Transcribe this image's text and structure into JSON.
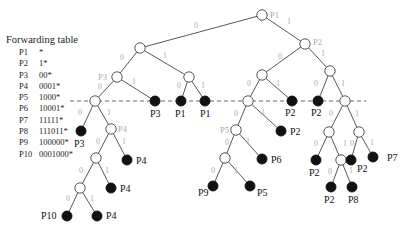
{
  "forwarding_table": {
    "title": "Forwarding table",
    "entries": [
      {
        "prefix_name": "P1",
        "prefix": "*"
      },
      {
        "prefix_name": "P2",
        "prefix": "1*"
      },
      {
        "prefix_name": "P3",
        "prefix": "00*"
      },
      {
        "prefix_name": "P4",
        "prefix": "0001*"
      },
      {
        "prefix_name": "P5",
        "prefix": "1000*"
      },
      {
        "prefix_name": "P6",
        "prefix": "10001*"
      },
      {
        "prefix_name": "P7",
        "prefix": "11111*"
      },
      {
        "prefix_name": "P8",
        "prefix": "111011*"
      },
      {
        "prefix_name": "P9",
        "prefix": "100000*"
      },
      {
        "prefix_name": "P10",
        "prefix": "0001000*"
      }
    ]
  },
  "colors": {
    "edge": "#444444",
    "edge_label": "#aaaaaa",
    "gray_prefix_label": "#aaaaaa",
    "leaf_fill": "#111111",
    "node_fill": "#ffffff",
    "dashed_line": "#555555"
  },
  "tree": {
    "dashed_line": {
      "x1": 70,
      "x2": 366,
      "y": 101
    },
    "nodes": [
      {
        "id": "root",
        "x": 262,
        "y": 15,
        "leaf": false,
        "label": "P1",
        "label_style": "gray",
        "lx": 270,
        "ly": 18
      },
      {
        "id": "0",
        "x": 140,
        "y": 48,
        "leaf": false
      },
      {
        "id": "1",
        "x": 305,
        "y": 44,
        "leaf": false,
        "label": "P2",
        "label_style": "gray",
        "lx": 313,
        "ly": 45
      },
      {
        "id": "00",
        "x": 117,
        "y": 77,
        "leaf": false,
        "label": "P3",
        "label_style": "gray",
        "lx": 98,
        "ly": 80
      },
      {
        "id": "01",
        "x": 189,
        "y": 77,
        "leaf": false
      },
      {
        "id": "000",
        "x": 95,
        "y": 101,
        "leaf": false
      },
      {
        "id": "001",
        "x": 155,
        "y": 101,
        "leaf": true,
        "label": "P3",
        "label_style": "black",
        "lx": 150,
        "ly": 117
      },
      {
        "id": "010",
        "x": 181,
        "y": 101,
        "leaf": true,
        "label": "P1",
        "label_style": "black",
        "lx": 175,
        "ly": 117
      },
      {
        "id": "011",
        "x": 205,
        "y": 101,
        "leaf": true,
        "label": "P1",
        "label_style": "black",
        "lx": 200,
        "ly": 117
      },
      {
        "id": "0000",
        "x": 81,
        "y": 131,
        "leaf": true,
        "label": "P3",
        "label_style": "black",
        "lx": 74,
        "ly": 147
      },
      {
        "id": "0001",
        "x": 111,
        "y": 129,
        "leaf": false,
        "label": "P4",
        "label_style": "gray",
        "lx": 118,
        "ly": 132
      },
      {
        "id": "00010",
        "x": 96,
        "y": 158,
        "leaf": false
      },
      {
        "id": "00011",
        "x": 127,
        "y": 160,
        "leaf": true,
        "label": "P4",
        "label_style": "black",
        "lx": 136,
        "ly": 164
      },
      {
        "id": "000100",
        "x": 80,
        "y": 188,
        "leaf": false
      },
      {
        "id": "000101",
        "x": 111,
        "y": 188,
        "leaf": true,
        "label": "P4",
        "label_style": "black",
        "lx": 120,
        "ly": 192
      },
      {
        "id": "0001000",
        "x": 67,
        "y": 216,
        "leaf": true,
        "label": "P10",
        "label_style": "black",
        "lx": 41,
        "ly": 219
      },
      {
        "id": "0001001",
        "x": 97,
        "y": 216,
        "leaf": true,
        "label": "P4",
        "label_style": "black",
        "lx": 106,
        "ly": 219
      },
      {
        "id": "10",
        "x": 262,
        "y": 75,
        "leaf": false
      },
      {
        "id": "11",
        "x": 330,
        "y": 71,
        "leaf": false
      },
      {
        "id": "100",
        "x": 248,
        "y": 101,
        "leaf": false
      },
      {
        "id": "101",
        "x": 292,
        "y": 101,
        "leaf": true,
        "label": "P2",
        "label_style": "black",
        "lx": 285,
        "ly": 116
      },
      {
        "id": "110",
        "x": 318,
        "y": 101,
        "leaf": true,
        "label": "P2",
        "label_style": "black",
        "lx": 311,
        "ly": 116
      },
      {
        "id": "111",
        "x": 345,
        "y": 101,
        "leaf": false
      },
      {
        "id": "1000",
        "x": 236,
        "y": 130,
        "leaf": false,
        "label": "P5",
        "label_style": "gray",
        "lx": 220,
        "ly": 133
      },
      {
        "id": "1001",
        "x": 281,
        "y": 131,
        "leaf": true,
        "label": "P2",
        "label_style": "black",
        "lx": 290,
        "ly": 135
      },
      {
        "id": "10000",
        "x": 225,
        "y": 158,
        "leaf": false
      },
      {
        "id": "10001",
        "x": 262,
        "y": 159,
        "leaf": true,
        "label": "P6",
        "label_style": "black",
        "lx": 271,
        "ly": 163
      },
      {
        "id": "100000",
        "x": 213,
        "y": 186,
        "leaf": true,
        "label": "P9",
        "label_style": "black",
        "lx": 198,
        "ly": 196
      },
      {
        "id": "100001",
        "x": 250,
        "y": 186,
        "leaf": true,
        "label": "P5",
        "label_style": "black",
        "lx": 257,
        "ly": 196
      },
      {
        "id": "1110",
        "x": 329,
        "y": 132,
        "leaf": false
      },
      {
        "id": "1111",
        "x": 359,
        "y": 132,
        "leaf": false
      },
      {
        "id": "11100",
        "x": 316,
        "y": 160,
        "leaf": true,
        "label": "P2",
        "label_style": "black",
        "lx": 309,
        "ly": 176
      },
      {
        "id": "11101",
        "x": 341,
        "y": 160,
        "leaf": false
      },
      {
        "id": "11110",
        "x": 351,
        "y": 160,
        "leaf": true,
        "label": "P2",
        "label_style": "black",
        "lx": 357,
        "ly": 172
      },
      {
        "id": "11111",
        "x": 373,
        "y": 157,
        "leaf": true,
        "label": "P7",
        "label_style": "black",
        "lx": 387,
        "ly": 161
      },
      {
        "id": "111010",
        "x": 331,
        "y": 187,
        "leaf": true,
        "label": "P2",
        "label_style": "black",
        "lx": 324,
        "ly": 203
      },
      {
        "id": "111011",
        "x": 352,
        "y": 187,
        "leaf": true,
        "label": "P8",
        "label_style": "black",
        "lx": 348,
        "ly": 203
      }
    ],
    "edges": [
      {
        "from": "root",
        "to": "0",
        "bit": "0",
        "lx": 196,
        "ly": 28
      },
      {
        "from": "root",
        "to": "1",
        "bit": "1",
        "lx": 289,
        "ly": 24
      },
      {
        "from": "0",
        "to": "00",
        "bit": "0",
        "lx": 122,
        "ly": 60
      },
      {
        "from": "0",
        "to": "01",
        "bit": "1",
        "lx": 165,
        "ly": 58
      },
      {
        "from": "1",
        "to": "10",
        "bit": "0",
        "lx": 280,
        "ly": 59
      },
      {
        "from": "1",
        "to": "11",
        "bit": "1",
        "lx": 323,
        "ly": 56
      },
      {
        "from": "00",
        "to": "000",
        "bit": "0",
        "lx": 100,
        "ly": 89
      },
      {
        "from": "00",
        "to": "001",
        "bit": "1",
        "lx": 134,
        "ly": 84
      },
      {
        "from": "01",
        "to": "010",
        "bit": "0",
        "lx": 179,
        "ly": 88
      },
      {
        "from": "01",
        "to": "011",
        "bit": "1",
        "lx": 203,
        "ly": 88
      },
      {
        "from": "10",
        "to": "100",
        "bit": "0",
        "lx": 249,
        "ly": 86
      },
      {
        "from": "10",
        "to": "101",
        "bit": "1",
        "lx": 278,
        "ly": 86
      },
      {
        "from": "11",
        "to": "110",
        "bit": "0",
        "lx": 316,
        "ly": 86
      },
      {
        "from": "11",
        "to": "111",
        "bit": "1",
        "lx": 343,
        "ly": 86
      },
      {
        "from": "000",
        "to": "0000",
        "bit": "0",
        "lx": 80,
        "ly": 115
      },
      {
        "from": "000",
        "to": "0001",
        "bit": "1",
        "lx": 109,
        "ly": 115
      },
      {
        "from": "0001",
        "to": "00010",
        "bit": "0",
        "lx": 98,
        "ly": 144
      },
      {
        "from": "0001",
        "to": "00011",
        "bit": "1",
        "lx": 124,
        "ly": 144
      },
      {
        "from": "00010",
        "to": "000100",
        "bit": "0",
        "lx": 81,
        "ly": 173
      },
      {
        "from": "00010",
        "to": "000101",
        "bit": "1",
        "lx": 107,
        "ly": 173
      },
      {
        "from": "000100",
        "to": "0001000",
        "bit": "0",
        "lx": 68,
        "ly": 201
      },
      {
        "from": "000100",
        "to": "0001001",
        "bit": "1",
        "lx": 92,
        "ly": 201
      },
      {
        "from": "100",
        "to": "1000",
        "bit": "0",
        "lx": 236,
        "ly": 116
      },
      {
        "from": "100",
        "to": "1001",
        "bit": "1",
        "lx": 263,
        "ly": 115
      },
      {
        "from": "1000",
        "to": "10000",
        "bit": "0",
        "lx": 227,
        "ly": 145
      },
      {
        "from": "1000",
        "to": "10001",
        "bit": "1",
        "lx": 248,
        "ly": 144
      },
      {
        "from": "10000",
        "to": "100000",
        "bit": "0",
        "lx": 213,
        "ly": 173
      },
      {
        "from": "10000",
        "to": "100001",
        "bit": "1",
        "lx": 236,
        "ly": 173
      },
      {
        "from": "111",
        "to": "1110",
        "bit": "0",
        "lx": 331,
        "ly": 116
      },
      {
        "from": "111",
        "to": "1111",
        "bit": "1",
        "lx": 357,
        "ly": 116
      },
      {
        "from": "1110",
        "to": "11100",
        "bit": "0",
        "lx": 316,
        "ly": 146
      },
      {
        "from": "1110",
        "to": "11101",
        "bit": "1",
        "lx": 345,
        "ly": 146
      },
      {
        "from": "1111",
        "to": "11110",
        "bit": "0",
        "lx": 352,
        "ly": 146
      },
      {
        "from": "1111",
        "to": "11111",
        "bit": "1",
        "lx": 372,
        "ly": 145
      },
      {
        "from": "11101",
        "to": "111010",
        "bit": "0",
        "lx": 330,
        "ly": 174
      },
      {
        "from": "11101",
        "to": "111011",
        "bit": "1",
        "lx": 351,
        "ly": 173
      }
    ]
  }
}
